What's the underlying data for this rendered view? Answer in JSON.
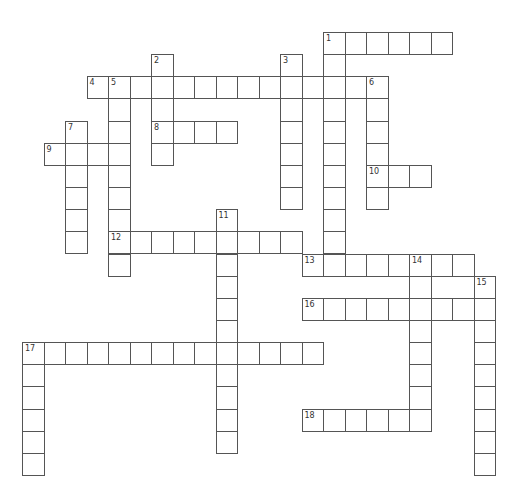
{
  "puzzle": {
    "type": "crossword",
    "cell_width": 21.5,
    "cell_height": 22.15,
    "origin_x": 22,
    "origin_y": 32,
    "line_color": "#555555",
    "across": [
      {
        "number": "1",
        "row": 0,
        "col": 14,
        "length": 6
      },
      {
        "number": "4",
        "row": 2,
        "col": 3,
        "length": 14
      },
      {
        "number": "8",
        "row": 4,
        "col": 6,
        "length": 4
      },
      {
        "number": "9",
        "row": 5,
        "col": 1,
        "length": 4
      },
      {
        "number": "10",
        "row": 6,
        "col": 16,
        "length": 3
      },
      {
        "number": "12",
        "row": 9,
        "col": 4,
        "length": 9
      },
      {
        "number": "13",
        "row": 10,
        "col": 13,
        "length": 8
      },
      {
        "number": "16",
        "row": 12,
        "col": 13,
        "length": 9
      },
      {
        "number": "17",
        "row": 14,
        "col": 0,
        "length": 14
      },
      {
        "number": "18",
        "row": 17,
        "col": 13,
        "length": 6
      }
    ],
    "down": [
      {
        "number": "1",
        "row": 0,
        "col": 14,
        "length": 11
      },
      {
        "number": "2",
        "row": 1,
        "col": 6,
        "length": 5
      },
      {
        "number": "3",
        "row": 1,
        "col": 12,
        "length": 7
      },
      {
        "number": "5",
        "row": 2,
        "col": 4,
        "length": 9
      },
      {
        "number": "6",
        "row": 2,
        "col": 16,
        "length": 6
      },
      {
        "number": "7",
        "row": 4,
        "col": 2,
        "length": 6
      },
      {
        "number": "11",
        "row": 8,
        "col": 9,
        "length": 11
      },
      {
        "number": "14",
        "row": 10,
        "col": 18,
        "length": 8
      },
      {
        "number": "15",
        "row": 11,
        "col": 21,
        "length": 9
      },
      {
        "number": "17",
        "row": 14,
        "col": 0,
        "length": 6
      }
    ]
  }
}
